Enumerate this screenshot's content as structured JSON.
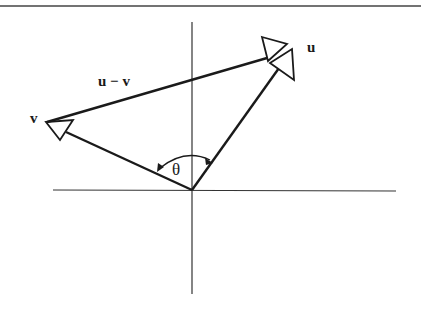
{
  "diagram": {
    "type": "vector-difference",
    "labels": {
      "u": "u",
      "v": "v",
      "u_minus_v": "u − v",
      "angle": "θ"
    },
    "colors": {
      "stroke": "#1a1a1a",
      "axis": "#333333",
      "background": "#ffffff"
    },
    "origin": [
      192,
      190
    ],
    "vectors": [
      {
        "name": "u",
        "from": [
          192,
          190
        ],
        "to": [
          280,
          66
        ]
      },
      {
        "name": "v",
        "from": [
          192,
          190
        ],
        "to": [
          62,
          131
        ]
      },
      {
        "name": "u − v",
        "from": [
          47,
          122
        ],
        "to": [
          268,
          56
        ]
      }
    ]
  }
}
